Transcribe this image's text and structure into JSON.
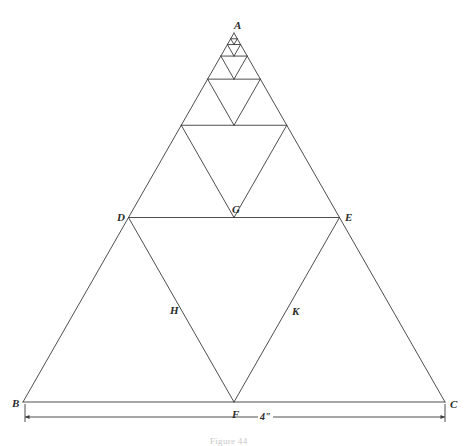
{
  "figure": {
    "caption": "Figure 44",
    "dimension_label": "4\"",
    "line_color": "#3a3a3a",
    "label_color": "#2b2b2b",
    "background": "#ffffff",
    "stroke_width": 0.9
  },
  "chart_data": {
    "type": "diagram",
    "units": "inches",
    "side_length": 4,
    "recursion_levels": 6,
    "xlim": [
      0,
      468
    ],
    "ylim": [
      0,
      445
    ],
    "grid": false,
    "legend": false,
    "points": [
      {
        "name": "A",
        "x": 234,
        "y": 33,
        "label_dx": 0,
        "label_dy": -13,
        "role": "apex-outer"
      },
      {
        "name": "B",
        "x": 23,
        "y": 402,
        "label_dx": -11,
        "label_dy": -4,
        "role": "base-left-outer"
      },
      {
        "name": "C",
        "x": 445,
        "y": 402,
        "label_dx": 5,
        "label_dy": -3,
        "role": "base-right-outer"
      },
      {
        "name": "D",
        "x": 128,
        "y": 217,
        "label_dx": -11,
        "label_dy": -5,
        "role": "midpoint-AB"
      },
      {
        "name": "E",
        "x": 339,
        "y": 217,
        "label_dx": 6,
        "label_dy": -5,
        "role": "midpoint-AC"
      },
      {
        "name": "F",
        "x": 234,
        "y": 402,
        "label_dx": -2,
        "label_dy": 7,
        "role": "midpoint-BC"
      },
      {
        "name": "G",
        "x": 234,
        "y": 217,
        "label_dx": -2,
        "label_dy": -13,
        "role": "apex-inner"
      },
      {
        "name": "H",
        "x": 181,
        "y": 310,
        "label_dx": -11,
        "label_dy": -5,
        "role": "midpoint-DF"
      },
      {
        "name": "K",
        "x": 287,
        "y": 310,
        "label_dx": 5,
        "label_dy": -4,
        "role": "midpoint-EF"
      }
    ],
    "dimension": {
      "from_x": 25,
      "to_x": 445,
      "y": 417,
      "extension_top": 404,
      "value": "4\"",
      "label_x": 258,
      "label_y": 412
    }
  },
  "labels": {
    "A": "A",
    "B": "B",
    "C": "C",
    "D": "D",
    "E": "E",
    "F": "F",
    "G": "G",
    "H": "H",
    "K": "K"
  }
}
